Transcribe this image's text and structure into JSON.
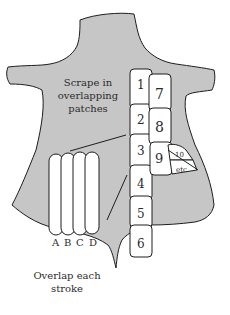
{
  "colors": {
    "hide_fill": "#c6c6c6",
    "outline": "#1e1e1e",
    "patch_fill": "#ffffff",
    "text": "#2b2b2b"
  },
  "caption_top": {
    "line1": "Scrape in",
    "line2": "overlapping",
    "line3": "patches"
  },
  "caption_bottom": {
    "line1": "Overlap each",
    "line2": "stroke"
  },
  "patches": {
    "p1": "1",
    "p2": "2",
    "p3": "3",
    "p4": "4",
    "p5": "5",
    "p6": "6",
    "p7": "7",
    "p8": "8",
    "p9": "9",
    "p10": "10",
    "etc": "etc"
  },
  "strokes": {
    "a": "A",
    "b": "B",
    "c": "C",
    "d": "D"
  }
}
